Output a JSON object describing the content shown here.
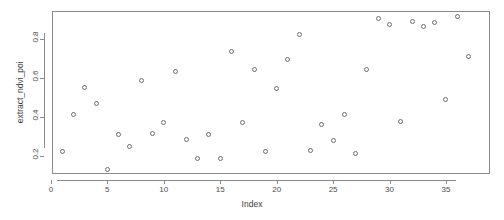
{
  "chart_data": {
    "type": "scatter",
    "title": "",
    "xlabel": "Index",
    "ylabel": "extract_ndvi_poi",
    "xlim": [
      0.1,
      38.9
    ],
    "ylim": [
      0.105,
      0.945
    ],
    "grid": false,
    "legend": null,
    "point_symbol": "open-circle",
    "point_color": "#6e6e6e",
    "frame_color": "#8a8a8a",
    "background": "#ffffff",
    "xticks": [
      0,
      5,
      10,
      15,
      20,
      25,
      30,
      35
    ],
    "xtick_labels": [
      "0",
      "5",
      "10",
      "15",
      "20",
      "25",
      "30",
      "35"
    ],
    "yticks": [
      0.2,
      0.4,
      0.6,
      0.8
    ],
    "ytick_labels": [
      "0.2",
      "0.4",
      "0.6",
      "0.8"
    ],
    "n_points": 37,
    "x": [
      1,
      2,
      3,
      4,
      5,
      6,
      7,
      8,
      9,
      10,
      11,
      12,
      13,
      14,
      15,
      16,
      17,
      18,
      19,
      20,
      21,
      22,
      23,
      24,
      25,
      26,
      27,
      28,
      29,
      30,
      31,
      32,
      33,
      34,
      35,
      36,
      37
    ],
    "y": [
      0.22,
      0.41,
      0.55,
      0.47,
      0.13,
      0.31,
      0.245,
      0.585,
      0.315,
      0.37,
      0.635,
      0.285,
      0.185,
      0.31,
      0.185,
      0.735,
      0.37,
      0.645,
      0.22,
      0.545,
      0.695,
      0.825,
      0.225,
      0.36,
      0.28,
      0.41,
      0.21,
      0.645,
      0.905,
      0.875,
      0.375,
      0.89,
      0.865,
      0.885,
      0.49,
      0.915,
      0.71
    ],
    "series": [
      {
        "name": "extract_ndvi_poi",
        "values": [
          0.22,
          0.41,
          0.55,
          0.47,
          0.13,
          0.31,
          0.245,
          0.585,
          0.315,
          0.37,
          0.635,
          0.285,
          0.185,
          0.31,
          0.185,
          0.735,
          0.37,
          0.645,
          0.22,
          0.545,
          0.695,
          0.825,
          0.225,
          0.36,
          0.28,
          0.41,
          0.21,
          0.645,
          0.905,
          0.875,
          0.375,
          0.89,
          0.865,
          0.885,
          0.49,
          0.915,
          0.71
        ]
      }
    ]
  }
}
